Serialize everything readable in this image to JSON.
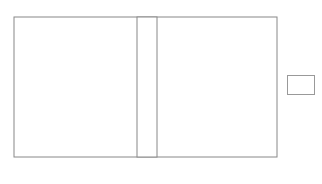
{
  "game": "backgammon",
  "board": {
    "colors": {
      "frame": "#888888",
      "dark_point": "#d3d3d3",
      "light_point": "#ffffff",
      "black_checker": "#111111",
      "white_checker": "#ffffff",
      "checker_outline": "#777777"
    },
    "top_labels": [
      "24",
      "23",
      "22",
      "21",
      "20",
      "19",
      "18",
      "17",
      "16",
      "15",
      "14",
      "13"
    ],
    "bottom_labels": [
      "1",
      "2",
      "3",
      "4",
      "5",
      "6",
      "7",
      "8",
      "9",
      "10",
      "11",
      "12"
    ],
    "points": [
      {
        "point": 1,
        "color": "none",
        "count": 0
      },
      {
        "point": 2,
        "color": "none",
        "count": 0
      },
      {
        "point": 3,
        "color": "none",
        "count": 0
      },
      {
        "point": 4,
        "color": "none",
        "count": 0
      },
      {
        "point": 5,
        "color": "black",
        "count": 2
      },
      {
        "point": 6,
        "color": "black",
        "count": 3
      },
      {
        "point": 7,
        "color": "none",
        "count": 0
      },
      {
        "point": 8,
        "color": "black",
        "count": 3
      },
      {
        "point": 9,
        "color": "black",
        "count": 2
      },
      {
        "point": 10,
        "color": "none",
        "count": 0
      },
      {
        "point": 11,
        "color": "none",
        "count": 0
      },
      {
        "point": 12,
        "color": "white",
        "count": 4
      },
      {
        "point": 13,
        "color": "black",
        "count": 3
      },
      {
        "point": 14,
        "color": "none",
        "count": 0
      },
      {
        "point": 15,
        "color": "none",
        "count": 0
      },
      {
        "point": 16,
        "color": "white",
        "count": 1
      },
      {
        "point": 17,
        "color": "white",
        "count": 3
      },
      {
        "point": 18,
        "color": "white",
        "count": 2
      },
      {
        "point": 19,
        "color": "white",
        "count": 5
      },
      {
        "point": 20,
        "color": "none",
        "count": 0
      },
      {
        "point": 21,
        "color": "none",
        "count": 0
      },
      {
        "point": 22,
        "color": "none",
        "count": 0
      },
      {
        "point": 23,
        "color": "black",
        "count": 1
      },
      {
        "point": 24,
        "color": "black",
        "count": 1
      }
    ]
  },
  "doubling_cube": {
    "value": ""
  }
}
